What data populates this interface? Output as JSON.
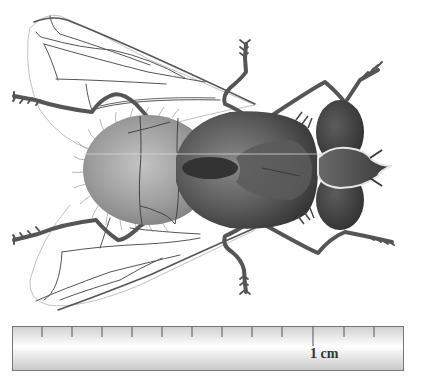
{
  "figure": {
    "colors": {
      "abdomen": "#9a9a9a",
      "thorax": "#4a4a4a",
      "head": "#3e3e3e",
      "legs": "#555555",
      "wing_veins": "#555555",
      "wing_outline": "#bdbdbd",
      "ruler_fill": "#eeeeee",
      "ruler_border": "#777777"
    },
    "parts": [
      "left-wing-upper",
      "left-wing-lower",
      "abdomen",
      "thorax",
      "head",
      "compound-eye-upper",
      "compound-eye-lower",
      "legs",
      "hairs"
    ]
  },
  "scale_bar": {
    "label": "1 cm",
    "tick_count": 12,
    "major_tick_index": 10
  }
}
